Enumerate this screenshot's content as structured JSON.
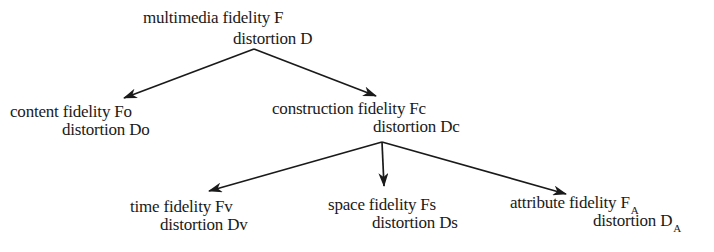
{
  "diagram": {
    "type": "tree",
    "nodes": {
      "root": {
        "fidelity_label": "multimedia fidelity  F",
        "distortion_label": "distortion D"
      },
      "content": {
        "fidelity_label": "content fidelity Fo",
        "distortion_label": "distortion Do"
      },
      "construction": {
        "fidelity_label": "construction fidelity Fc",
        "distortion_label": "distortion Dc"
      },
      "time": {
        "fidelity_label": "time fidelity Fv",
        "distortion_label": "distortion Dv"
      },
      "space": {
        "fidelity_label": "space fidelity Fs",
        "distortion_label": "distortion Ds"
      },
      "attribute": {
        "fidelity_label": "attribute fidelity F",
        "fidelity_subscript": "A",
        "distortion_label": "distortion D",
        "distortion_subscript": "A"
      }
    },
    "edges": [
      {
        "from": "root",
        "to": "content"
      },
      {
        "from": "root",
        "to": "construction"
      },
      {
        "from": "construction",
        "to": "time"
      },
      {
        "from": "construction",
        "to": "space"
      },
      {
        "from": "construction",
        "to": "attribute"
      }
    ],
    "colors": {
      "ink": "#1a1a1a",
      "background": "#ffffff"
    }
  }
}
